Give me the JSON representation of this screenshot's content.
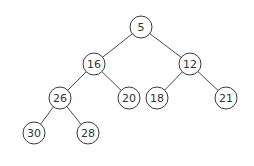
{
  "diagram": {
    "type": "binary-tree (min-heap)",
    "nodes": [
      {
        "id": "n5",
        "label": "5",
        "x": 141,
        "y": 27
      },
      {
        "id": "n16",
        "label": "16",
        "x": 94,
        "y": 64
      },
      {
        "id": "n12",
        "label": "12",
        "x": 190,
        "y": 64
      },
      {
        "id": "n26",
        "label": "26",
        "x": 60,
        "y": 98
      },
      {
        "id": "n20",
        "label": "20",
        "x": 129,
        "y": 98
      },
      {
        "id": "n18",
        "label": "18",
        "x": 157,
        "y": 98
      },
      {
        "id": "n21",
        "label": "21",
        "x": 226,
        "y": 98
      },
      {
        "id": "n30",
        "label": "30",
        "x": 34,
        "y": 133
      },
      {
        "id": "n28",
        "label": "28",
        "x": 88,
        "y": 133
      }
    ],
    "edges": [
      [
        "n5",
        "n16"
      ],
      [
        "n5",
        "n12"
      ],
      [
        "n16",
        "n26"
      ],
      [
        "n16",
        "n20"
      ],
      [
        "n12",
        "n18"
      ],
      [
        "n12",
        "n21"
      ],
      [
        "n26",
        "n30"
      ],
      [
        "n26",
        "n28"
      ]
    ],
    "node_radius": 11
  }
}
